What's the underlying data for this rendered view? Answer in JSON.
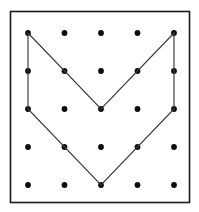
{
  "figure": {
    "kind": "geoboard-diagram",
    "background_color": "#ffffff",
    "title_text": ""
  },
  "frame": {
    "x": 10.5,
    "y": 11.5,
    "width": 179,
    "height": 191,
    "stroke_color": "#1a1a1a",
    "stroke_width": 1.6,
    "fill_color": "#ffffff"
  },
  "grid": {
    "rows": 5,
    "columns": 5,
    "dot_count": 25,
    "dot_radius": 2.9,
    "dot_color": "#0c0c0c",
    "column_x": [
      28,
      64.5,
      101,
      137.5,
      174
    ],
    "row_y": [
      33,
      71,
      109,
      147,
      185
    ],
    "points": [
      {
        "col": 1,
        "row": 1,
        "x": 28,
        "y": 33
      },
      {
        "col": 2,
        "row": 1,
        "x": 64.5,
        "y": 33
      },
      {
        "col": 3,
        "row": 1,
        "x": 101,
        "y": 33
      },
      {
        "col": 4,
        "row": 1,
        "x": 137.5,
        "y": 33
      },
      {
        "col": 5,
        "row": 1,
        "x": 174,
        "y": 33
      },
      {
        "col": 1,
        "row": 2,
        "x": 28,
        "y": 71
      },
      {
        "col": 2,
        "row": 2,
        "x": 64.5,
        "y": 71
      },
      {
        "col": 3,
        "row": 2,
        "x": 101,
        "y": 71
      },
      {
        "col": 4,
        "row": 2,
        "x": 137.5,
        "y": 71
      },
      {
        "col": 5,
        "row": 2,
        "x": 174,
        "y": 71
      },
      {
        "col": 1,
        "row": 3,
        "x": 28,
        "y": 109
      },
      {
        "col": 2,
        "row": 3,
        "x": 64.5,
        "y": 109
      },
      {
        "col": 3,
        "row": 3,
        "x": 101,
        "y": 109
      },
      {
        "col": 4,
        "row": 3,
        "x": 137.5,
        "y": 109
      },
      {
        "col": 5,
        "row": 3,
        "x": 174,
        "y": 109
      },
      {
        "col": 1,
        "row": 4,
        "x": 28,
        "y": 147
      },
      {
        "col": 2,
        "row": 4,
        "x": 64.5,
        "y": 147
      },
      {
        "col": 3,
        "row": 4,
        "x": 101,
        "y": 147
      },
      {
        "col": 4,
        "row": 4,
        "x": 137.5,
        "y": 147
      },
      {
        "col": 5,
        "row": 4,
        "x": 174,
        "y": 147
      },
      {
        "col": 1,
        "row": 5,
        "x": 28,
        "y": 185
      },
      {
        "col": 2,
        "row": 5,
        "x": 64.5,
        "y": 185
      },
      {
        "col": 3,
        "row": 5,
        "x": 101,
        "y": 185
      },
      {
        "col": 4,
        "row": 5,
        "x": 137.5,
        "y": 185
      },
      {
        "col": 5,
        "row": 5,
        "x": 174,
        "y": 185
      }
    ]
  },
  "shape": {
    "name": "chevron-band",
    "closed": true,
    "stroke_color": "#3a3a3a",
    "stroke_width": 1.15,
    "fill": "none",
    "vertices_grid": [
      {
        "col": 1,
        "row": 1
      },
      {
        "col": 3,
        "row": 3
      },
      {
        "col": 5,
        "row": 1
      },
      {
        "col": 5,
        "row": 3
      },
      {
        "col": 3,
        "row": 5
      },
      {
        "col": 1,
        "row": 3
      }
    ],
    "vertices_px": [
      {
        "x": 28,
        "y": 33
      },
      {
        "x": 101,
        "y": 109
      },
      {
        "x": 174,
        "y": 33
      },
      {
        "x": 174,
        "y": 109
      },
      {
        "x": 101,
        "y": 185
      },
      {
        "x": 28,
        "y": 109
      }
    ],
    "path_d": "M 28 33 L 101 109 L 174 33 L 174 109 L 101 185 L 28 109 Z"
  }
}
